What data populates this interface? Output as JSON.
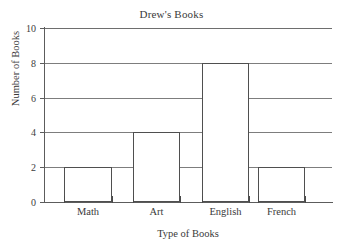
{
  "chart_data": {
    "type": "bar",
    "title": "Drew's Books",
    "xlabel": "Type of Books",
    "ylabel": "Number of Books",
    "categories": [
      "Math",
      "Art",
      "English",
      "French"
    ],
    "values": [
      2,
      4,
      8,
      2
    ],
    "ylim": [
      0,
      10
    ],
    "yticks": [
      0,
      2,
      4,
      6,
      8,
      10
    ],
    "ytick_labels": [
      "0",
      "2",
      "4",
      "6",
      "8",
      "10"
    ],
    "grid": true,
    "grid_axis": "y",
    "legend": null,
    "bar_fill_color": "#ffffff",
    "bar_edge_color": "#4f4f4f",
    "grid_color": "#7d7d7d",
    "axis_color": "#5c5c5c",
    "text_color": "#3a3a3a",
    "background_color": "#ffffff"
  }
}
